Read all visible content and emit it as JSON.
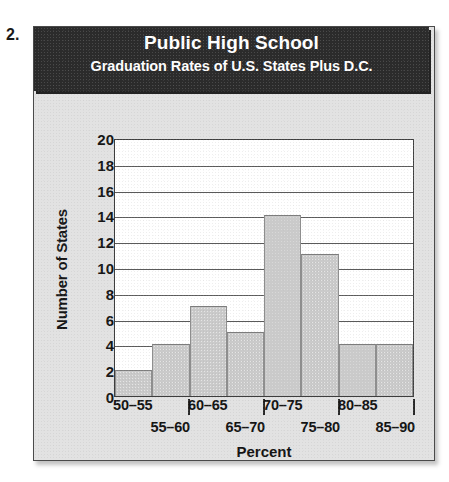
{
  "problem": {
    "number": "2."
  },
  "header": {
    "title_main": "Public High School",
    "title_sub": "Graduation Rates of U.S. States Plus D.C."
  },
  "colors": {
    "panel_background": "#e2e2e2",
    "title_bar": "#2b2b2b",
    "title_text": "#ffffff",
    "plot_background": "#ffffff",
    "bar_fill": "#cacaca",
    "bar_border": "#8e8e8e",
    "gridline": "#5a5a5a",
    "axis_line": "#3d3d3d",
    "text": "#131313"
  },
  "chart_data": {
    "type": "bar",
    "title": "Public High School",
    "subtitle": "Graduation Rates of U.S. States Plus D.C.",
    "xlabel": "Percent",
    "ylabel": "Number of States",
    "categories": [
      "50–55",
      "55–60",
      "60–65",
      "65–70",
      "70–75",
      "75–80",
      "80–85",
      "85–90"
    ],
    "values": [
      2,
      4,
      7,
      5,
      14,
      11,
      4,
      4
    ],
    "ylim": [
      0,
      20
    ],
    "ytick_labels": [
      "20",
      "18",
      "16",
      "14",
      "12",
      "10",
      "8",
      "6",
      "4",
      "2",
      "0"
    ],
    "ytick_values": [
      20,
      18,
      16,
      14,
      12,
      10,
      8,
      6,
      4,
      2,
      0
    ],
    "ytick_step": 2,
    "grid": "horizontal",
    "legend": "none",
    "histogram": true,
    "bin_width": 5,
    "x_labels_staggered": true,
    "x_labels_top_row": [
      "50–55",
      "60–65",
      "70–75",
      "80–85"
    ],
    "x_labels_bottom_row": [
      "55–60",
      "65–70",
      "75–80",
      "85–90"
    ],
    "x_separator_count": 4
  }
}
